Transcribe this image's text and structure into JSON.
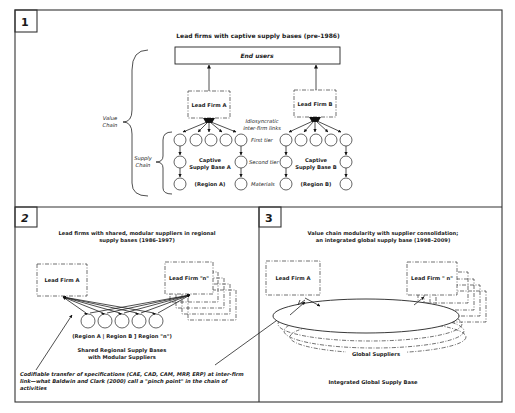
{
  "panel1": {
    "number": "1",
    "title": "Lead firms with captive supply bases (pre-1986)",
    "end_users": "End users",
    "lead_firm_a": "Lead Firm A",
    "lead_firm_b": "Lead Firm B",
    "idiosyncratic_line1": "Idiosyncratic",
    "idiosyncratic_line2": "inter-firm links",
    "value_chain_line1": "Value",
    "value_chain_line2": "Chain",
    "supply_chain_line1": "Supply",
    "supply_chain_line2": "Chain",
    "first_tier": "First tier",
    "second_tier": "Second tier",
    "materials": "Materials",
    "supply_base_a_line1": "Captive",
    "supply_base_a_line2": "Supply Base A",
    "region_a": "(Region A)",
    "supply_base_b_line1": "Captive",
    "supply_base_b_line2": "Supply Base B",
    "region_b": "(Region B)"
  },
  "panel2": {
    "number": "2",
    "title_line1": "Lead firms with shared, modular suppliers in regional",
    "title_line2": "supply bases (1986-1997)",
    "lead_firm_a": "Lead Firm A",
    "lead_firm_n": "Lead Firm \"n\"",
    "regions": "(Region A | Region B ] Region \"n\")",
    "shared_line1": "Shared Regional Supply Bases",
    "shared_line2": "with Modular Suppliers",
    "note_line1": "Codifiable transfer of specifications (CAE, CAD, CAM, MRP, ERP) at inter-firm",
    "note_line2": "link—what Baldwin and Clark (2000) call a \"pinch point\" in the chain of",
    "note_line3": "activities"
  },
  "panel3": {
    "number": "3",
    "title_line1": "Value chain modularity with supplier consolidation;",
    "title_line2": "an integrated global supply base (1998–2009)",
    "lead_firm_a": "Lead Firm A",
    "lead_firm_n": "Lead Firm \" n\"",
    "global_suppliers": "Global Suppliers",
    "integrated": "Integrated Global Supply Base"
  },
  "colors": {
    "line": "#222222",
    "background": "#ffffff"
  }
}
